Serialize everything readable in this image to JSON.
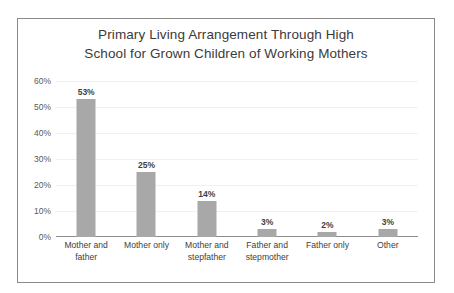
{
  "chart_data": {
    "type": "bar",
    "title": "Primary Living Arrangement Through High School for Grown Children of Working Mothers",
    "title_lines": [
      "Primary Living Arrangement Through High",
      "School for Grown Children of Working Mothers"
    ],
    "categories": [
      "Mother and father",
      "Mother only",
      "Mother and stepfather",
      "Father and stepmother",
      "Father only",
      "Other"
    ],
    "category_lines": [
      [
        "Mother and",
        "father"
      ],
      [
        "Mother only"
      ],
      [
        "Mother and",
        "stepfather"
      ],
      [
        "Father and",
        "stepmother"
      ],
      [
        "Father only"
      ],
      [
        "Other"
      ]
    ],
    "values": [
      53,
      25,
      14,
      3,
      2,
      3
    ],
    "data_labels": [
      "53%",
      "25%",
      "14%",
      "3%",
      "2%",
      "3%"
    ],
    "ytick_labels": [
      "60%",
      "50%",
      "40%",
      "30%",
      "20%",
      "10%",
      "0%"
    ],
    "ytick_values": [
      60,
      50,
      40,
      30,
      20,
      10,
      0
    ],
    "ylim": [
      0,
      60
    ],
    "xlabel": "",
    "ylabel": "",
    "grid": true,
    "legend": false,
    "colors": {
      "bar": "#a8a8a8",
      "grid": "#f0f0f0",
      "axis": "#8c8c8c",
      "border": "#8a8a8a",
      "title_text": "#3b3b3b",
      "tick_text": "#595959",
      "label_text": "#404040",
      "background": "#ffffff"
    }
  }
}
